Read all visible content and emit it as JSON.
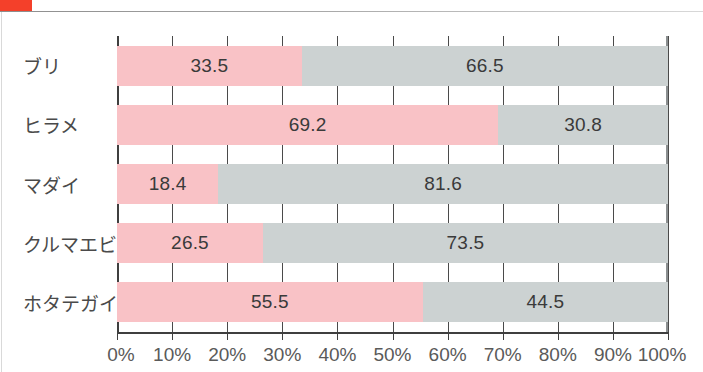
{
  "page": {
    "accent_color": "#f4402a",
    "background": "#ffffff"
  },
  "chart_data": {
    "type": "bar",
    "orientation": "horizontal",
    "stacked": true,
    "normalized_percent": true,
    "title": "",
    "subtitle": "",
    "xlabel": "",
    "ylabel": "",
    "xlim": [
      0,
      100
    ],
    "grid": true,
    "legend_position": "none",
    "categories": [
      "ブリ",
      "ヒラメ",
      "マダイ",
      "クルマエビ",
      "ホタテガイ"
    ],
    "xticks": [
      "0%",
      "10%",
      "20%",
      "30%",
      "40%",
      "50%",
      "60%",
      "70%",
      "80%",
      "90%",
      "100%"
    ],
    "xtick_values": [
      0,
      10,
      20,
      30,
      40,
      50,
      60,
      70,
      80,
      90,
      100
    ],
    "series": [
      {
        "name": "series-a",
        "color": "#f9c2c6",
        "values": [
          33.5,
          69.2,
          18.4,
          26.5,
          55.5
        ],
        "labels": [
          "33.5",
          "69.2",
          "18.4",
          "26.5",
          "55.5"
        ]
      },
      {
        "name": "series-b",
        "color": "#ccd2d2",
        "values": [
          66.5,
          30.8,
          81.6,
          73.5,
          44.5
        ],
        "labels": [
          "66.5",
          "30.8",
          "81.6",
          "73.5",
          "44.5"
        ]
      }
    ]
  }
}
